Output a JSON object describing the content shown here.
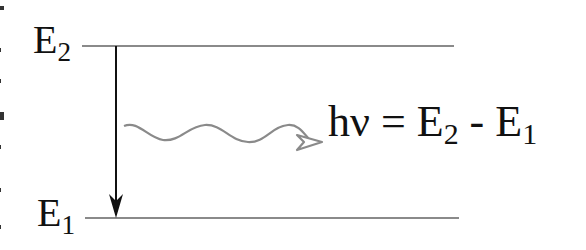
{
  "diagram": {
    "type": "energy-level-emission",
    "levels": [
      {
        "id": "upper",
        "label_main": "E",
        "label_sub": "2"
      },
      {
        "id": "lower",
        "label_main": "E",
        "label_sub": "1"
      }
    ],
    "transition": {
      "from": "upper",
      "to": "lower",
      "direction": "down"
    },
    "photon": {
      "style": "wavy-arrow",
      "color": "#8a8a8a"
    },
    "equation": {
      "lhs": "hν",
      "eq": "=",
      "term1_main": "E",
      "term1_sub": "2",
      "op": "-",
      "term2_main": "E",
      "term2_sub": "1"
    },
    "colors": {
      "level_line": "#8a8a8a",
      "arrow": "#111111",
      "text": "#111111"
    }
  }
}
